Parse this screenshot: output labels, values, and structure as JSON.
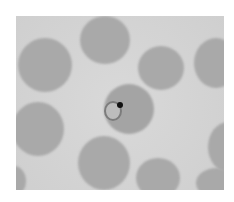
{
  "image": {
    "subject": "blood smear micrograph",
    "description": "Grayscale microscopy of red blood cells with one central cell containing a ring-form parasite with a dark chromatin dot",
    "colors": {
      "background": "#d4d4d4",
      "cell": "#a9a9a9",
      "chromatin": "#111111"
    }
  }
}
